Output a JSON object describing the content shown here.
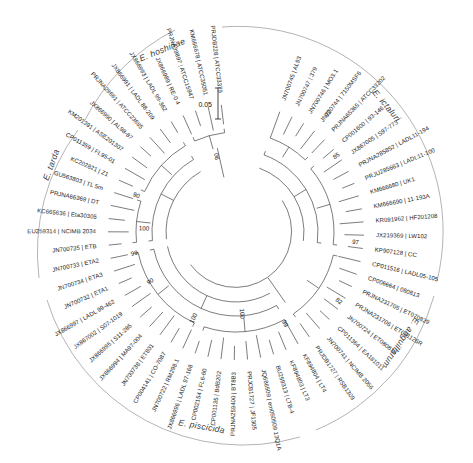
{
  "figure": {
    "type": "circular-phylogenetic-tree",
    "scale_bar_label": "0.05",
    "scale_bar_value": 0.05
  },
  "species_labels": [
    {
      "name": "E. hoshinae",
      "text": "E. hoshinae"
    },
    {
      "name": "E. tarda",
      "text": "E. tarda"
    },
    {
      "name": "E. ictaluri",
      "text": "E. ictaluri"
    },
    {
      "name": "E. anguillarum",
      "text": "E. anguillarum"
    },
    {
      "name": "E. piscicida",
      "text": "E. piscicida"
    }
  ],
  "bootstrap_values": [
    "92",
    "85",
    "97",
    "82",
    "99",
    "100",
    "100",
    "90",
    "99",
    "100",
    "90",
    "90"
  ],
  "tips": [
    {
      "accession": "JN700745",
      "strain": "AL93",
      "label": "JN700745 | AL93"
    },
    {
      "accession": "JN700747",
      "strain": "379",
      "label": "JN700747 | 379"
    },
    {
      "accession": "JN700746",
      "strain": "MO3.1",
      "label": "JN700746 | MO3.1"
    },
    {
      "accession": "JN700744",
      "strain": "7150MSF6",
      "label": "JN700744 | 7150MSF6"
    },
    {
      "accession": "PRJNA65365",
      "strain": "ATCC33202",
      "label": "PRJNA65365 | ATCC33202"
    },
    {
      "accession": "CP001600",
      "strain": "93-146",
      "label": "CP001600 | 93-146"
    },
    {
      "accession": "JX867005",
      "strain": "S97-773",
      "label": "JX867005 | S97-773"
    },
    {
      "accession": "PRJNA285852",
      "strain": "LADL11-194",
      "label": "PRJNA285852 | LADL11-194"
    },
    {
      "accession": "PRJU285663",
      "strain": "LADL11-100",
      "label": "PRJU285663 | LADL11-100"
    },
    {
      "accession": "KM666680",
      "strain": "UK1",
      "label": "KM666680 | UK1"
    },
    {
      "accession": "KM666690",
      "strain": "11-193A",
      "label": "KM666690 | 11-193A"
    },
    {
      "accession": "KR091962",
      "strain": "HF201208",
      "label": "KR091962 | HF201208"
    },
    {
      "accession": "JX219369",
      "strain": "LW102",
      "label": "JX219369 | LW102"
    },
    {
      "accession": "KP907128",
      "strain": "CC",
      "label": "KP907128 | CC"
    },
    {
      "accession": "CP011516",
      "strain": "LADL05-105",
      "label": "CP011516 | LADL05-105"
    },
    {
      "accession": "CP006664",
      "strain": "080813",
      "label": "CP006664 | 080813"
    },
    {
      "accession": "PRJNA231705",
      "strain": "ET070829",
      "label": "PRJNA231705 | ET070829"
    },
    {
      "accession": "PRJNA231706",
      "strain": "ET081126R",
      "label": "PRJNA231706 | ET081126R"
    },
    {
      "accession": "JN700724",
      "strain": "ET080814",
      "label": "JN700724 | ET080814"
    },
    {
      "accession": "CP011364",
      "strain": "EA181011",
      "label": "CP011364 | EA181011"
    },
    {
      "accession": "JN700741",
      "strain": "NCIMB 2056",
      "label": "JN700741 | NCIMB 2056"
    },
    {
      "accession": "PRJDB1727",
      "strain": "RSB1309",
      "label": "PRJDB1727 | RSB1309"
    },
    {
      "accession": "KF894804",
      "strain": "LT4",
      "label": "KF894804 | LT4"
    },
    {
      "accession": "KF894803",
      "strain": "LT3",
      "label": "KF894803 | LT3"
    },
    {
      "accession": "BU259313",
      "strain": "LTB-4",
      "label": "BU259313 | LTB-4"
    },
    {
      "accession": "JQ686509",
      "strain": "em050509 13Q1A",
      "label": "JQ686509 | em050509 13Q1A"
    },
    {
      "accession": "PRJCB1727",
      "strain": "JF1305",
      "label": "PRJCB1727 | JF1305"
    },
    {
      "accession": "PRJNA259400",
      "strain": "BT8B3",
      "label": "PRJNA259400 | BT8B3"
    },
    {
      "accession": "CP001135",
      "strain": "BdB202",
      "label": "CP001135 | BdB202"
    },
    {
      "accession": "CP002154",
      "strain": "FL6-60",
      "label": "CP002154 | FL6-60"
    },
    {
      "accession": "JX866996",
      "strain": "LADL 97-168",
      "label": "JX866996 | LADL 97-168"
    },
    {
      "accession": "JN700722",
      "strain": "RM298.1",
      "label": "JN700722 | RM298.1"
    },
    {
      "accession": "CP004141",
      "strain": "CO-7087",
      "label": "CP004141 | CO-7087"
    },
    {
      "accession": "JN700738",
      "strain": "ET801",
      "label": "JN700738 | ET801"
    },
    {
      "accession": "JX866994",
      "strain": "MA97-004",
      "label": "JX866994 | MA97-004"
    },
    {
      "accession": "JX866995",
      "strain": "S11-285",
      "label": "JX866995 | S11-285"
    },
    {
      "accession": "JX867002",
      "strain": "S07-1019",
      "label": "JX867002 | S07-1019"
    },
    {
      "accession": "JX866997",
      "strain": "LADL 99-462",
      "label": "JX866997 | LADL 99-462"
    },
    {
      "accession": "JN700732",
      "strain": "ETA1",
      "label": "JN700732 | ETA1"
    },
    {
      "accession": "JN700734",
      "strain": "ETA3",
      "label": "JN700734 | ETA3"
    },
    {
      "accession": "JN700733",
      "strain": "ETA2",
      "label": "JN700733 | ETA2"
    },
    {
      "accession": "JN700735",
      "strain": "ETB",
      "label": "JN700735 | ETB"
    },
    {
      "accession": "EU259314",
      "strain": "NCIMB 2034",
      "label": "EU259314 | NCIMB 2034"
    },
    {
      "accession": "KC665636",
      "strain": "Eta30305",
      "label": "KC665636 | Eta30305"
    },
    {
      "accession": "PRJNA66369",
      "strain": "DT",
      "label": "PRJNA66369 | DT"
    },
    {
      "accession": "GU563803",
      "strain": "TL 5m",
      "label": "GU563803 | TL 5m"
    },
    {
      "accession": "KC202821",
      "strain": "Z1",
      "label": "KC202821 | Z1"
    },
    {
      "accession": "CP011359",
      "strain": "FL95-01",
      "label": "CP011359 | FL95-01"
    },
    {
      "accession": "KM201391",
      "strain": "ASE201307",
      "label": "KM201391 | ASE201307"
    },
    {
      "accession": "JX866990",
      "strain": "AL98-87",
      "label": "JX866990 | AL98-87"
    },
    {
      "accession": "PRJNA29661",
      "strain": "ATCC23685",
      "label": "PRJNA29661 | ATCC23685"
    },
    {
      "accession": "JX866991",
      "strain": "LADL 88-209",
      "label": "JX866991 | LADL 88-209"
    },
    {
      "accession": "JX866993",
      "strain": "LADL 99-362",
      "label": "JX866993 | LADL 99-362"
    },
    {
      "accession": "JX866989",
      "strain": "RE-0 4",
      "label": "JX866989 | RE-0 4"
    },
    {
      "accession": "PRJNA39897",
      "strain": "ATCC15947",
      "label": "PRJNA39897 | ATCC15947"
    },
    {
      "accession": "KM666678",
      "strain": "ATCC35051",
      "label": "KM666678 | ATCC35051"
    },
    {
      "accession": "PRJDB228",
      "strain": "ATCC33379",
      "label": "PRJDB228 | ATCC33379"
    }
  ],
  "colors": {
    "branch": "#2a2a2a",
    "text": "#1b1b1b",
    "species_arc": "#9b9b9b",
    "background": "#ffffff"
  }
}
